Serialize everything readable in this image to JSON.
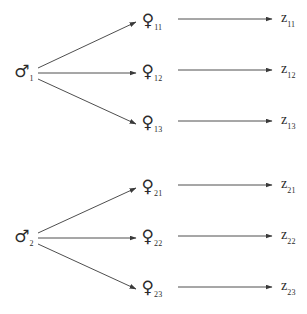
{
  "figure": {
    "type": "nested-mating-design-diagram",
    "background_color": "#ffffff",
    "line_color": "#3a3a3a",
    "text_color": "#2b2b2b"
  },
  "symbols": {
    "male": "♂",
    "female": "♀",
    "observation_letter": "z"
  },
  "groups": [
    {
      "sire": {
        "label": "♂",
        "subscript": "1",
        "x": 24,
        "y": 73
      },
      "dams": [
        {
          "label": "♀",
          "subscript": "11",
          "x": 152,
          "y": 22
        },
        {
          "label": "♀",
          "subscript": "12",
          "x": 152,
          "y": 73
        },
        {
          "label": "♀",
          "subscript": "13",
          "x": 152,
          "y": 124
        }
      ],
      "observations": [
        {
          "label": "z",
          "subscript": "11",
          "x": 281,
          "y": 19
        },
        {
          "label": "z",
          "subscript": "12",
          "x": 281,
          "y": 70
        },
        {
          "label": "z",
          "subscript": "13",
          "x": 281,
          "y": 121
        }
      ],
      "sire_to_dam_edges": [
        {
          "x1": 38,
          "y1": 68,
          "x2": 136,
          "y2": 22
        },
        {
          "x1": 38,
          "y1": 73,
          "x2": 136,
          "y2": 73
        },
        {
          "x1": 38,
          "y1": 79,
          "x2": 136,
          "y2": 124
        }
      ],
      "dam_to_obs_edges": [
        {
          "x1": 178,
          "y1": 19,
          "x2": 272,
          "y2": 19
        },
        {
          "x1": 178,
          "y1": 70,
          "x2": 272,
          "y2": 70
        },
        {
          "x1": 178,
          "y1": 121,
          "x2": 272,
          "y2": 121
        }
      ]
    },
    {
      "sire": {
        "label": "♂",
        "subscript": "2",
        "x": 24,
        "y": 238
      },
      "dams": [
        {
          "label": "♀",
          "subscript": "21",
          "x": 152,
          "y": 188
        },
        {
          "label": "♀",
          "subscript": "22",
          "x": 152,
          "y": 238
        },
        {
          "label": "♀",
          "subscript": "23",
          "x": 152,
          "y": 289
        }
      ],
      "observations": [
        {
          "label": "z",
          "subscript": "21",
          "x": 281,
          "y": 185
        },
        {
          "label": "z",
          "subscript": "22",
          "x": 281,
          "y": 236
        },
        {
          "label": "z",
          "subscript": "23",
          "x": 281,
          "y": 287
        }
      ],
      "sire_to_dam_edges": [
        {
          "x1": 38,
          "y1": 233,
          "x2": 136,
          "y2": 188
        },
        {
          "x1": 38,
          "y1": 238,
          "x2": 136,
          "y2": 238
        },
        {
          "x1": 38,
          "y1": 244,
          "x2": 136,
          "y2": 289
        }
      ],
      "dam_to_obs_edges": [
        {
          "x1": 178,
          "y1": 185,
          "x2": 272,
          "y2": 185
        },
        {
          "x1": 178,
          "y1": 236,
          "x2": 272,
          "y2": 236
        },
        {
          "x1": 178,
          "y1": 287,
          "x2": 272,
          "y2": 287
        }
      ]
    }
  ]
}
